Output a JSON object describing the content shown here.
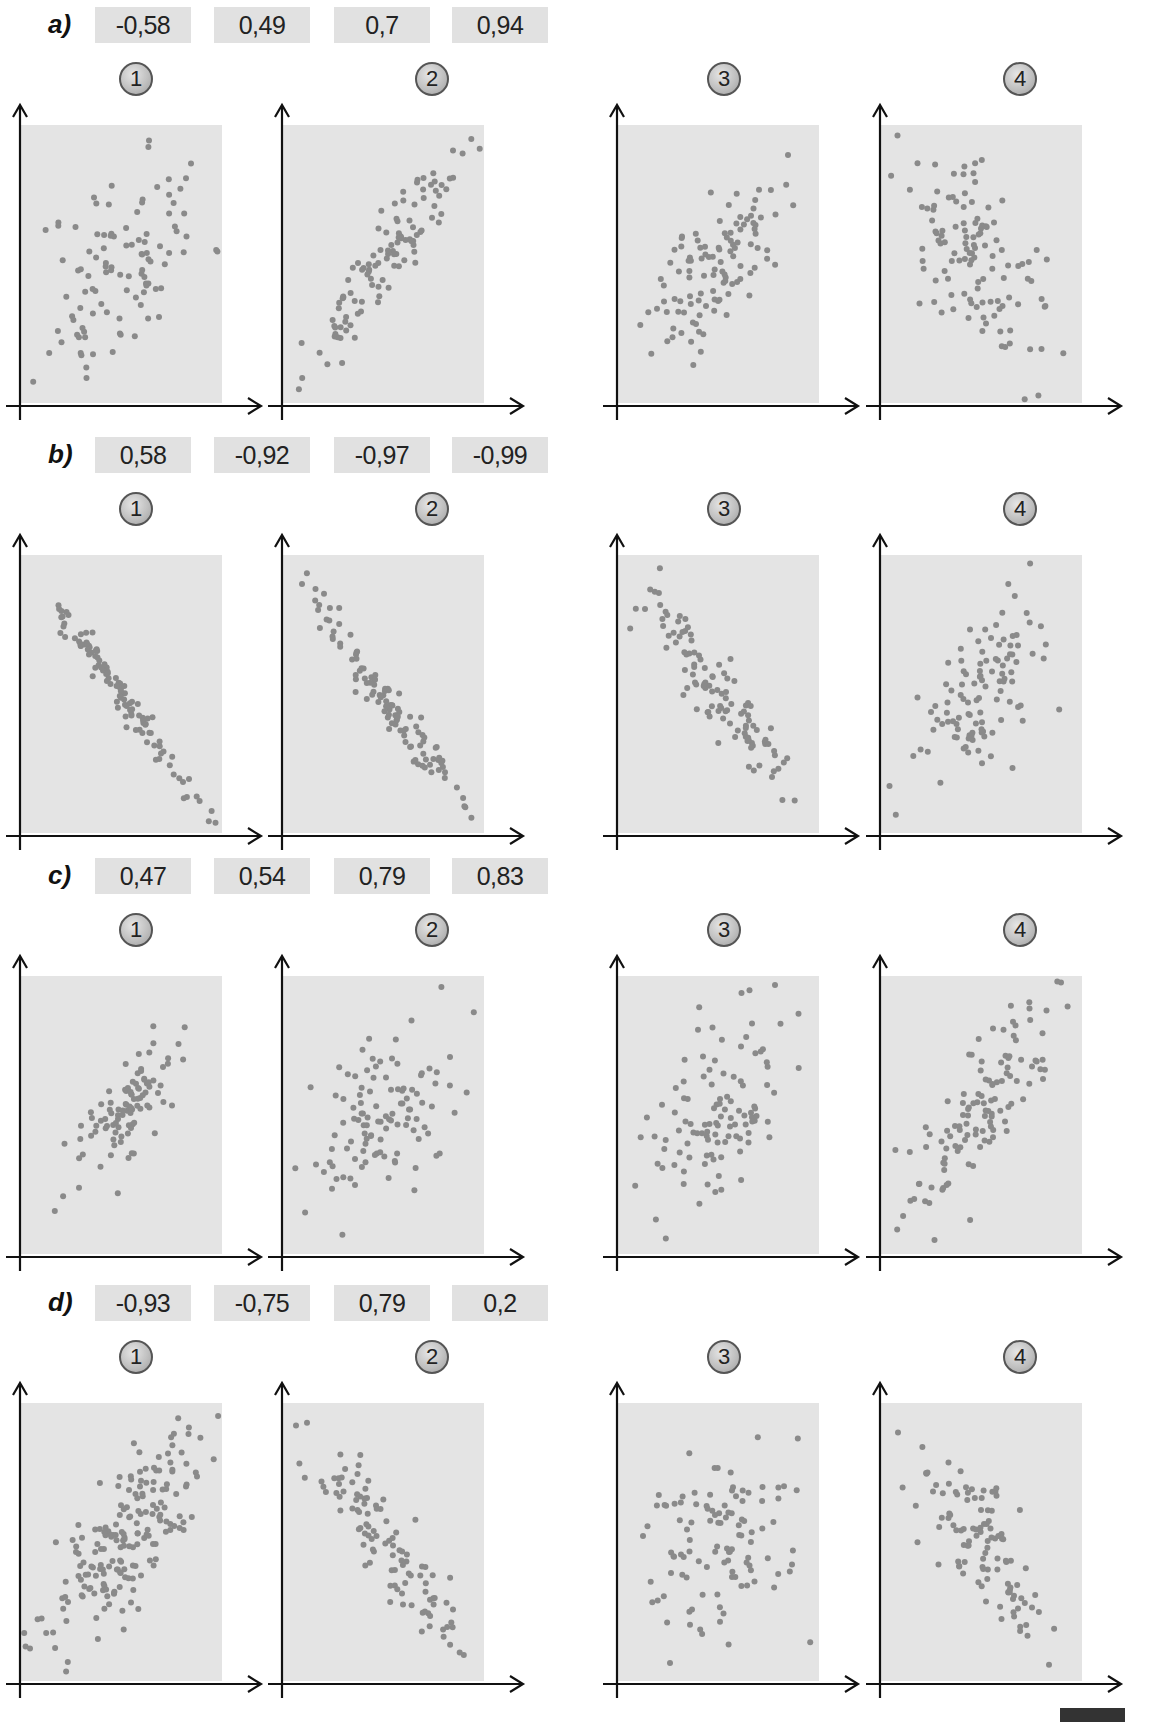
{
  "exercise": {
    "rows": [
      {
        "label": "a)",
        "coefficients": [
          "-0,58",
          "0,49",
          "0,7",
          "0,94"
        ],
        "panels": [
          {
            "number": "1",
            "r": 0.49,
            "n": 110,
            "spread": 0.8,
            "seed": 11
          },
          {
            "number": "2",
            "r": 0.94,
            "n": 110,
            "spread": 0.7,
            "seed": 23
          },
          {
            "number": "3",
            "r": 0.7,
            "n": 110,
            "spread": 0.6,
            "seed": 37
          },
          {
            "number": "4",
            "r": -0.58,
            "n": 120,
            "spread": 0.7,
            "seed": 41
          }
        ]
      },
      {
        "label": "b)",
        "coefficients": [
          "0,58",
          "-0,92",
          "-0,97",
          "-0,99"
        ],
        "panels": [
          {
            "number": "1",
            "r": -0.99,
            "n": 110,
            "spread": 0.85,
            "seed": 53
          },
          {
            "number": "2",
            "r": -0.97,
            "n": 110,
            "spread": 0.8,
            "seed": 61
          },
          {
            "number": "3",
            "r": -0.92,
            "n": 110,
            "spread": 0.75,
            "seed": 71
          },
          {
            "number": "4",
            "r": 0.58,
            "n": 110,
            "spread": 0.6,
            "seed": 83
          }
        ]
      },
      {
        "label": "c)",
        "coefficients": [
          "0,47",
          "0,54",
          "0,79",
          "0,83"
        ],
        "panels": [
          {
            "number": "1",
            "r": 0.83,
            "n": 100,
            "spread": 0.6,
            "seed": 97
          },
          {
            "number": "2",
            "r": 0.54,
            "n": 110,
            "spread": 0.65,
            "seed": 101
          },
          {
            "number": "3",
            "r": 0.47,
            "n": 110,
            "spread": 0.65,
            "seed": 113
          },
          {
            "number": "4",
            "r": 0.79,
            "n": 120,
            "spread": 0.75,
            "seed": 127
          }
        ]
      },
      {
        "label": "d)",
        "coefficients": [
          "-0,93",
          "-0,75",
          "0,79",
          "0,2"
        ],
        "panels": [
          {
            "number": "1",
            "r": 0.79,
            "n": 190,
            "spread": 0.75,
            "seed": 131
          },
          {
            "number": "2",
            "r": -0.93,
            "n": 110,
            "spread": 0.8,
            "seed": 149
          },
          {
            "number": "3",
            "r": 0.2,
            "n": 110,
            "spread": 0.6,
            "seed": 157
          },
          {
            "number": "4",
            "r": -0.75,
            "n": 110,
            "spread": 0.65,
            "seed": 163
          }
        ]
      }
    ]
  },
  "colors": {
    "plot_background": "#e4e4e4",
    "point": "#8a8a8a",
    "axis": "#111111",
    "coefficient_box": "#e1e1e1"
  },
  "chart_data": [
    {
      "type": "scatter",
      "title": "a) 1",
      "xlabel": "",
      "ylabel": "",
      "correlation_options": [
        -0.58,
        0.49,
        0.7,
        0.94
      ],
      "approx_r": 0.49,
      "grid": false
    },
    {
      "type": "scatter",
      "title": "a) 2",
      "approx_r": 0.94,
      "grid": false
    },
    {
      "type": "scatter",
      "title": "a) 3",
      "approx_r": 0.7,
      "grid": false
    },
    {
      "type": "scatter",
      "title": "a) 4",
      "approx_r": -0.58,
      "grid": false
    },
    {
      "type": "scatter",
      "title": "b) 1",
      "correlation_options": [
        0.58,
        -0.92,
        -0.97,
        -0.99
      ],
      "approx_r": -0.99,
      "grid": false
    },
    {
      "type": "scatter",
      "title": "b) 2",
      "approx_r": -0.97,
      "grid": false
    },
    {
      "type": "scatter",
      "title": "b) 3",
      "approx_r": -0.92,
      "grid": false
    },
    {
      "type": "scatter",
      "title": "b) 4",
      "approx_r": 0.58,
      "grid": false
    },
    {
      "type": "scatter",
      "title": "c) 1",
      "correlation_options": [
        0.47,
        0.54,
        0.79,
        0.83
      ],
      "approx_r": 0.83,
      "grid": false
    },
    {
      "type": "scatter",
      "title": "c) 2",
      "approx_r": 0.54,
      "grid": false
    },
    {
      "type": "scatter",
      "title": "c) 3",
      "approx_r": 0.47,
      "grid": false
    },
    {
      "type": "scatter",
      "title": "c) 4",
      "approx_r": 0.79,
      "grid": false
    },
    {
      "type": "scatter",
      "title": "d) 1",
      "correlation_options": [
        -0.93,
        -0.75,
        0.79,
        0.2
      ],
      "approx_r": 0.79,
      "grid": false
    },
    {
      "type": "scatter",
      "title": "d) 2",
      "approx_r": -0.93,
      "grid": false
    },
    {
      "type": "scatter",
      "title": "d) 3",
      "approx_r": 0.2,
      "grid": false
    },
    {
      "type": "scatter",
      "title": "d) 4",
      "approx_r": -0.75,
      "grid": false
    }
  ]
}
